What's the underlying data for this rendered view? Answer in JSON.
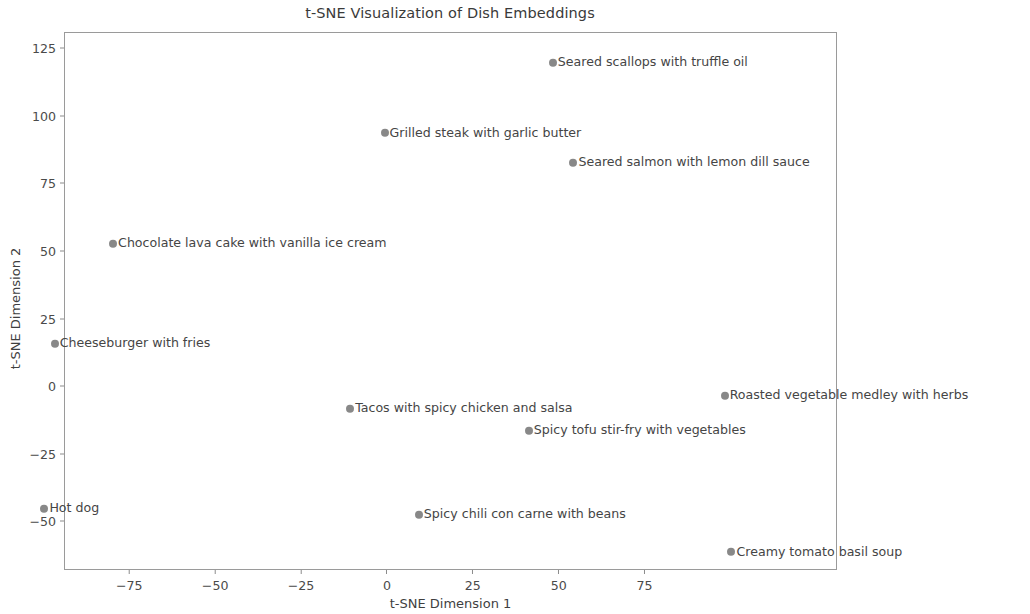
{
  "chart_data": {
    "type": "scatter",
    "title": "t-SNE Visualization of Dish Embeddings",
    "xlabel": "t-SNE Dimension 1",
    "ylabel": "t-SNE Dimension 2",
    "xlim": [
      -94,
      131
    ],
    "ylim": [
      -68,
      131
    ],
    "xticks": [
      -75,
      -50,
      -25,
      0,
      25,
      50,
      75
    ],
    "xtick_labels": [
      "−75",
      "−50",
      "−25",
      "0",
      "25",
      "50",
      "75"
    ],
    "yticks": [
      -50,
      -25,
      0,
      25,
      50,
      75,
      100,
      125
    ],
    "ytick_labels": [
      "−50",
      "−25",
      "0",
      "25",
      "50",
      "75",
      "100",
      "125"
    ],
    "grid": false,
    "legend": null,
    "marker_color": "#6e6e6e",
    "points": [
      {
        "label": "Seared scallops with truffle oil",
        "x": 48,
        "y": 120
      },
      {
        "label": "Grilled steak with garlic butter",
        "x": -1,
        "y": 94
      },
      {
        "label": "Seared salmon with lemon dill sauce",
        "x": 54,
        "y": 83
      },
      {
        "label": "Chocolate lava cake with vanilla ice cream",
        "x": -80,
        "y": 53
      },
      {
        "label": "Cheeseburger with fries",
        "x": -97,
        "y": 16
      },
      {
        "label": "Roasted vegetable medley with herbs",
        "x": 98,
        "y": -3
      },
      {
        "label": "Tacos with spicy chicken and salsa",
        "x": -11,
        "y": -8
      },
      {
        "label": "Spicy tofu stir-fry with vegetables",
        "x": 41,
        "y": -16
      },
      {
        "label": "Hot dog",
        "x": -100,
        "y": -45
      },
      {
        "label": "Spicy chili con carne with beans",
        "x": 9,
        "y": -47
      },
      {
        "label": "Creamy tomato basil soup",
        "x": 100,
        "y": -61
      }
    ]
  }
}
